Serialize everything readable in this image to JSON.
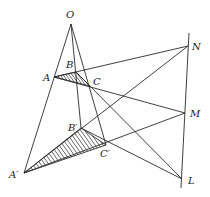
{
  "diagram": {
    "line_color": "#2a2a2a",
    "points": {
      "O": {
        "x": 71,
        "y": 24,
        "label": "O",
        "lx": 66,
        "ly": 18
      },
      "A": {
        "x": 54,
        "y": 77,
        "label": "A",
        "lx": 43,
        "ly": 81
      },
      "B": {
        "x": 76,
        "y": 72,
        "label": "B",
        "lx": 66,
        "ly": 68
      },
      "C": {
        "x": 90,
        "y": 86,
        "label": "C",
        "lx": 93,
        "ly": 85
      },
      "A1": {
        "x": 24,
        "y": 173,
        "label": "A′",
        "lx": 9,
        "ly": 178
      },
      "B1": {
        "x": 81,
        "y": 128,
        "label": "B′",
        "lx": 68,
        "ly": 131
      },
      "C1": {
        "x": 106,
        "y": 145,
        "label": "C′",
        "lx": 100,
        "ly": 157
      },
      "N": {
        "x": 188,
        "y": 46,
        "label": "N",
        "lx": 192,
        "ly": 50
      },
      "M": {
        "x": 185,
        "y": 113,
        "label": "M",
        "lx": 190,
        "ly": 117
      },
      "L": {
        "x": 182,
        "y": 179,
        "label": "L",
        "lx": 188,
        "ly": 184
      }
    },
    "axis_line": {
      "x1": 189,
      "y1": 33,
      "x2": 181,
      "y2": 188
    },
    "segments": [
      [
        "O",
        "A1"
      ],
      [
        "O",
        "B1"
      ],
      [
        "O",
        "C1"
      ],
      [
        "A",
        "N"
      ],
      [
        "A",
        "M"
      ],
      [
        "B",
        "L"
      ],
      [
        "A",
        "C"
      ],
      [
        "B",
        "C"
      ],
      [
        "A1",
        "N"
      ],
      [
        "A1",
        "M"
      ],
      [
        "B1",
        "L"
      ],
      [
        "B1",
        "C1"
      ]
    ],
    "shaded_triangles": [
      [
        "A1",
        "B1",
        "C1"
      ],
      [
        "A",
        "B",
        "C"
      ]
    ]
  }
}
